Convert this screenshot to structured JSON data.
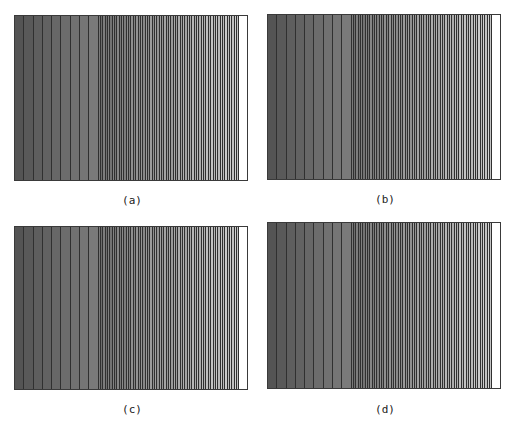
{
  "figure": {
    "panels": [
      {
        "id": "a",
        "caption": "(a)",
        "box": {
          "x": 14,
          "y": 15,
          "w": 234,
          "h": 166
        },
        "caption_pos": {
          "x": 102,
          "y": 194
        }
      },
      {
        "id": "b",
        "caption": "(b)",
        "box": {
          "x": 267,
          "y": 14,
          "w": 234,
          "h": 166
        },
        "caption_pos": {
          "x": 355,
          "y": 193
        }
      },
      {
        "id": "c",
        "caption": "(c)",
        "box": {
          "x": 14,
          "y": 226,
          "w": 234,
          "h": 164
        },
        "caption_pos": {
          "x": 102,
          "y": 403
        }
      },
      {
        "id": "d",
        "caption": "(d)",
        "box": {
          "x": 267,
          "y": 222,
          "w": 234,
          "h": 167
        },
        "caption_pos": {
          "x": 355,
          "y": 403
        }
      }
    ],
    "bands": {
      "wide_count": 9,
      "wide_width": 9.3,
      "narrow_count": 60,
      "narrow_width": 2.35,
      "color_start": "#545454",
      "color_mid": "#7a7a7a",
      "color_end": "#d2d2d2",
      "line_color": "#303030"
    }
  }
}
